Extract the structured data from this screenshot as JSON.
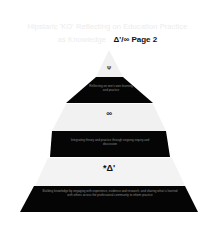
{
  "title": {
    "line1": "Hipstaric 'KO' Reflecting on Education Practice",
    "line2_prefix": "as Knowledge",
    "page_label": "Δ'/∞ Page 2"
  },
  "pyramid": {
    "colors": {
      "light": "#f1f1f1",
      "dark": "#050505",
      "dark_text": "#8a8a8a",
      "light_text": "#222222"
    },
    "levels": [
      {
        "id": "level-1",
        "fill": "light",
        "symbol": "Ψ",
        "text": ""
      },
      {
        "id": "level-2",
        "fill": "dark",
        "symbol": "",
        "text": "Reflecting on one's own learning and practice"
      },
      {
        "id": "level-3",
        "fill": "light",
        "symbol": "∞",
        "text": ""
      },
      {
        "id": "level-4",
        "fill": "dark",
        "symbol": "",
        "text": "Integrating theory and practice through ongoing inquiry and discussion"
      },
      {
        "id": "level-5",
        "fill": "light",
        "symbol": "*Δ'",
        "text": ""
      },
      {
        "id": "level-6",
        "fill": "dark",
        "symbol": "",
        "text": "Building knowledge by engaging with experience, evidence and research, and sharing what is learned with others across the professional community to inform practice"
      }
    ]
  }
}
